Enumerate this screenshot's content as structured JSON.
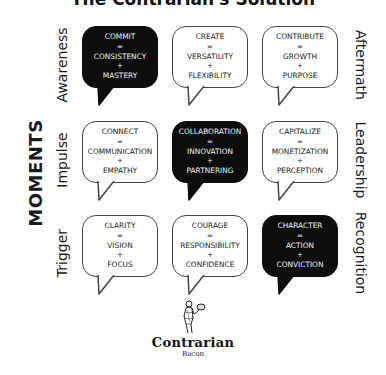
{
  "title": "The Contrarian's Solution",
  "axis_label": "MOMENTS",
  "rows": [
    {
      "left_label": "Awareness",
      "right_label": "Aftermath",
      "cells": [
        {
          "top": "COMMIT",
          "eq": "=",
          "middle": "CONSISTENCY",
          "plus": "+",
          "bottom": "MASTERY",
          "style": "dark"
        },
        {
          "top": "CREATE",
          "eq": "=",
          "middle": "VERSATILITY",
          "plus": "+",
          "bottom": "FLEXIBILITY",
          "style": "light"
        },
        {
          "top": "CONTRIBUTE",
          "eq": "=",
          "middle": "GROWTH",
          "plus": "+",
          "bottom": "PURPOSE",
          "style": "light"
        }
      ]
    },
    {
      "left_label": "Impulse",
      "right_label": "Leadership",
      "cells": [
        {
          "top": "CONNECT",
          "eq": "=",
          "middle": "COMMUNICATION",
          "plus": "+",
          "bottom": "EMPATHY",
          "style": "light"
        },
        {
          "top": "COLLABORATION",
          "eq": "=",
          "middle": "INNOVATION",
          "plus": "+",
          "bottom": "PARTNERING",
          "style": "dark"
        },
        {
          "top": "CAPITALIZE",
          "eq": "=",
          "middle": "MONETIZATION",
          "plus": "+",
          "bottom": "PERCEPTION",
          "style": "light"
        }
      ]
    },
    {
      "left_label": "Trigger",
      "right_label": "Recognition",
      "cells": [
        {
          "top": "CLARITY",
          "eq": "=",
          "middle": "VISION",
          "plus": "+",
          "bottom": "FOCUS",
          "style": "light"
        },
        {
          "top": "COURAGE",
          "eq": "=",
          "middle": "RESPONSIBILITY",
          "plus": "+",
          "bottom": "CONFIDENCE",
          "style": "light"
        },
        {
          "top": "CHARACTER",
          "eq": "=",
          "middle": "ACTION",
          "plus": "+",
          "bottom": "CONVICTION",
          "style": "dark"
        }
      ]
    }
  ],
  "logo": {
    "name": "Contrarian",
    "sub": "Bacon",
    "icon": "waiter-figure-icon"
  },
  "colors": {
    "dark_bubble": "#0d0d0d",
    "light_bubble": "#ffffff",
    "outline": "#444444"
  }
}
